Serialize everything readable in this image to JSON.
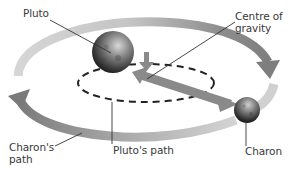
{
  "diagram": {
    "labels": {
      "pluto": "Pluto",
      "centre_of_gravity": "Centre of\ngravity",
      "charons_path": "Charon's\npath",
      "plutos_path": "Pluto's path",
      "charon": "Charon"
    },
    "colors": {
      "outer_orbit_light": "#d2d2d2",
      "outer_orbit_dark": "#8e8e8e",
      "inner_orbit_dashed": "#222222",
      "leader_lines": "#333333",
      "text": "#3a3a3a"
    },
    "elements": {
      "pluto_body": "large sphere (Pluto)",
      "charon_body": "small sphere (Charon)",
      "inner_orbit": "dashed ellipse (Pluto's path)",
      "outer_orbit": "wide arrowed ellipse (Charon's path)",
      "barycentre_arrow": "short down arrow marking centre of gravity",
      "pluto_charon_arrow": "long arrow from centre toward Charon"
    }
  }
}
